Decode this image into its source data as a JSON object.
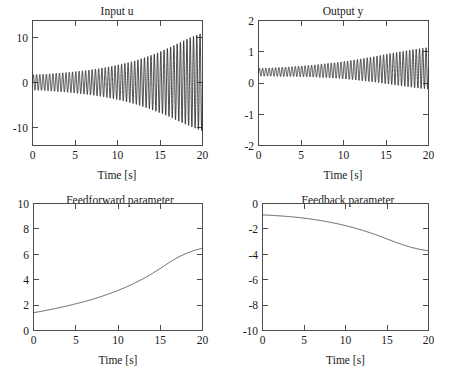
{
  "figure": {
    "background": "#ffffff",
    "line_color": "#1a1a1a",
    "axis_color": "#4d4d4d",
    "layout": "2x2 subplot grid"
  },
  "chart_data": [
    {
      "id": "input-u",
      "type": "line",
      "title": "Input u",
      "xlabel": "Time [s]",
      "ylabel": "",
      "xlim": [
        0,
        20
      ],
      "ylim": [
        -15,
        15
      ],
      "xticks": [
        0,
        5,
        10,
        15,
        20
      ],
      "xticklabels": [
        "0",
        "5",
        "10",
        "15",
        "20"
      ],
      "yticks": [
        -10,
        0,
        10
      ],
      "yticklabels": [
        "-10",
        "0",
        "10"
      ],
      "grid": false,
      "legend": "none",
      "description": "Sinusoidal control input with exponentially growing amplitude",
      "series": [
        {
          "name": "u(t)",
          "envelope_upper": [
            2.0,
            2.1,
            2.3,
            2.5,
            2.8,
            3.1,
            3.5,
            4.0,
            4.6,
            5.3,
            6.2,
            7.2,
            8.4,
            9.7,
            11.0,
            12.0
          ],
          "envelope_lower": [
            -1.7,
            -1.8,
            -2.0,
            -2.2,
            -2.5,
            -2.8,
            -3.2,
            -3.7,
            -4.3,
            -5.0,
            -5.9,
            -6.9,
            -8.0,
            -9.3,
            -10.5,
            -11.5
          ],
          "frequency_hz": 2.6,
          "t_start": 0,
          "t_end": 20
        }
      ]
    },
    {
      "id": "output-y",
      "type": "line",
      "title": "Output y",
      "xlabel": "Time [s]",
      "ylabel": "",
      "xlim": [
        0,
        20
      ],
      "ylim": [
        -2,
        2
      ],
      "xticks": [
        0,
        5,
        10,
        15,
        20
      ],
      "xticklabels": [
        "0",
        "5",
        "10",
        "15",
        "20"
      ],
      "yticks": [
        -2,
        -1,
        0,
        1,
        2
      ],
      "yticklabels": [
        "-2",
        "-1",
        "0",
        "1",
        "2"
      ],
      "grid": false,
      "legend": "none",
      "description": "Plant output oscillating about a slowly rising mean with growing amplitude",
      "series": [
        {
          "name": "y(t)",
          "envelope_upper": [
            0.47,
            0.48,
            0.5,
            0.52,
            0.55,
            0.58,
            0.62,
            0.66,
            0.71,
            0.77,
            0.83,
            0.9,
            0.97,
            1.03,
            1.09,
            1.14
          ],
          "envelope_lower": [
            0.22,
            0.22,
            0.21,
            0.21,
            0.2,
            0.19,
            0.17,
            0.15,
            0.12,
            0.08,
            0.04,
            -0.01,
            -0.06,
            -0.11,
            -0.16,
            -0.2
          ],
          "frequency_hz": 2.6,
          "t_start": 0,
          "t_end": 20
        }
      ]
    },
    {
      "id": "feedforward-parameter",
      "type": "line",
      "title": "Feedforward parameter",
      "xlabel": "Time [s]",
      "ylabel": "",
      "xlim": [
        0,
        20
      ],
      "ylim": [
        0,
        10
      ],
      "xticks": [
        0,
        5,
        10,
        15,
        20
      ],
      "xticklabels": [
        "0",
        "5",
        "10",
        "15",
        "20"
      ],
      "yticks": [
        0,
        2,
        4,
        6,
        8,
        10
      ],
      "yticklabels": [
        "0",
        "2",
        "4",
        "6",
        "8",
        "10"
      ],
      "grid": false,
      "legend": "none",
      "description": "Monotonically increasing convex adaptation curve",
      "series": [
        {
          "name": "theta_ff(t)",
          "x": [
            0,
            1,
            2,
            3,
            4,
            5,
            6,
            7,
            8,
            9,
            10,
            11,
            12,
            13,
            14,
            15,
            16,
            17,
            18,
            19,
            20
          ],
          "values": [
            1.4,
            1.52,
            1.65,
            1.79,
            1.94,
            2.1,
            2.27,
            2.46,
            2.67,
            2.9,
            3.15,
            3.43,
            3.74,
            4.08,
            4.46,
            4.88,
            5.33,
            5.73,
            6.05,
            6.3,
            6.48
          ]
        }
      ]
    },
    {
      "id": "feedback-parameter",
      "type": "line",
      "title": "Feedback parameter",
      "xlabel": "Time [s]",
      "ylabel": "",
      "xlim": [
        0,
        20
      ],
      "ylim": [
        -10,
        0
      ],
      "xticks": [
        0,
        5,
        10,
        15,
        20
      ],
      "xticklabels": [
        "0",
        "5",
        "10",
        "15",
        "20"
      ],
      "yticks": [
        -10,
        -8,
        -6,
        -4,
        -2,
        0
      ],
      "yticklabels": [
        "-10",
        "-8",
        "-6",
        "-4",
        "-2",
        "0"
      ],
      "grid": false,
      "legend": "none",
      "description": "Monotonically decreasing concave adaptation curve",
      "series": [
        {
          "name": "theta_fb(t)",
          "x": [
            0,
            1,
            2,
            3,
            4,
            5,
            6,
            7,
            8,
            9,
            10,
            11,
            12,
            13,
            14,
            15,
            16,
            17,
            18,
            19,
            20
          ],
          "values": [
            -0.9,
            -0.93,
            -0.97,
            -1.02,
            -1.08,
            -1.15,
            -1.24,
            -1.34,
            -1.46,
            -1.59,
            -1.74,
            -1.91,
            -2.1,
            -2.31,
            -2.54,
            -2.79,
            -3.04,
            -3.27,
            -3.47,
            -3.62,
            -3.72
          ]
        }
      ]
    }
  ]
}
